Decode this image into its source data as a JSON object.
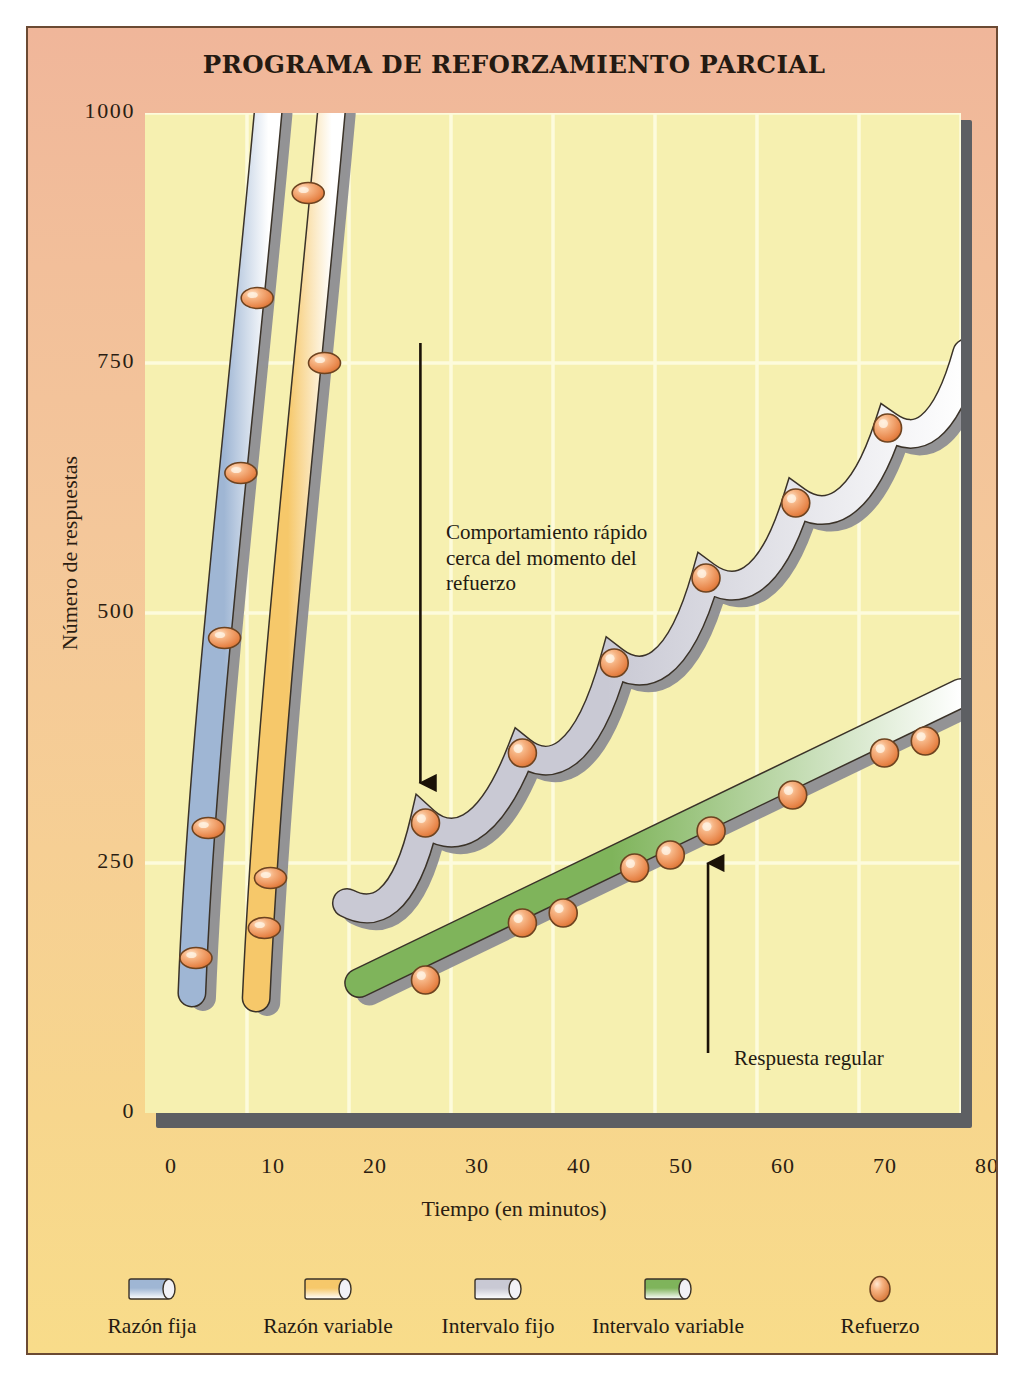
{
  "figure": {
    "title": "PROGRAMA DE REFORZAMIENTO PARCIAL",
    "frame_border_color": "#6b4a33",
    "bg_top_color": "#f0b69a",
    "bg_bottom_color": "#f8dc8a",
    "plot_bg_color": "#f6f0b0",
    "plot_shadow_color": "#5d5f63",
    "gridline_color": "#fdfbdc"
  },
  "annotations": [
    {
      "name": "fast-behavior-note",
      "text": "Comportamiento rápido cerca del momento del refuerzo",
      "arrow": "down"
    },
    {
      "name": "steady-response-note",
      "text": "Respuesta regular",
      "arrow": "up"
    }
  ],
  "legend": {
    "position": "bottom",
    "items": [
      {
        "label": "Razón fija",
        "icon": "cylinder-swatch",
        "color": "#9fb6d4",
        "shape": "cylinder"
      },
      {
        "label": "Razón variable",
        "icon": "cylinder-swatch",
        "color": "#f6c86a",
        "shape": "cylinder"
      },
      {
        "label": "Intervalo fijo",
        "icon": "cylinder-swatch",
        "color": "#c9c9d4",
        "shape": "cylinder"
      },
      {
        "label": "Intervalo variable",
        "icon": "cylinder-swatch",
        "color": "#7fb45b",
        "shape": "cylinder"
      },
      {
        "label": "Refuerzo",
        "icon": "sphere-swatch",
        "color": "#ef9a5f",
        "shape": "sphere"
      }
    ]
  },
  "chart_data": {
    "type": "line",
    "title": "PROGRAMA DE REFORZAMIENTO PARCIAL",
    "xlabel": "Tiempo (en minutos)",
    "ylabel": "Número de respuestas",
    "xlim": [
      0,
      80
    ],
    "ylim": [
      0,
      1000
    ],
    "xticks": [
      0,
      10,
      20,
      30,
      40,
      50,
      60,
      70,
      80
    ],
    "yticks": [
      0,
      250,
      500,
      750,
      1000
    ],
    "grid": true,
    "legend_position": "bottom",
    "marker_label": "Refuerzo",
    "series": [
      {
        "name": "Razón fija",
        "color": "#9fb6d4",
        "style": "thick-band",
        "description": "Muy rápida y constante; reforzadores a intervalos regulares de respuestas",
        "x": [
          4.5,
          5.0,
          6.2,
          7.8,
          9.4,
          11.0,
          12.6
        ],
        "y": [
          125,
          155,
          285,
          475,
          640,
          815,
          1000
        ],
        "reinforcement_points": [
          {
            "x": 5.0,
            "y": 155
          },
          {
            "x": 6.2,
            "y": 285
          },
          {
            "x": 7.8,
            "y": 475
          },
          {
            "x": 9.4,
            "y": 640
          },
          {
            "x": 11.0,
            "y": 815
          }
        ]
      },
      {
        "name": "Razón variable",
        "color": "#f6c86a",
        "style": "thick-band",
        "description": "Rápida y constante; reforzadores tras un número variable de respuestas",
        "x": [
          11.0,
          11.7,
          12.3,
          14.2,
          16.0,
          17.6,
          19.0
        ],
        "y": [
          120,
          185,
          235,
          490,
          750,
          920,
          1000
        ],
        "reinforcement_points": [
          {
            "x": 11.7,
            "y": 185
          },
          {
            "x": 12.3,
            "y": 235
          },
          {
            "x": 17.6,
            "y": 750
          },
          {
            "x": 16.0,
            "y": 920
          }
        ]
      },
      {
        "name": "Intervalo fijo",
        "color": "#c9c9d4",
        "style": "scalloped-band",
        "description": "Patrón festoneado: pausa después del refuerzo, aceleración antes del siguiente",
        "x": [
          19.5,
          23.0,
          27.5,
          32.0,
          37.0,
          41.5,
          46.0,
          50.5,
          55.0,
          59.5,
          63.8,
          68.5,
          72.8,
          77.0,
          80.0
        ],
        "y": [
          215,
          200,
          290,
          265,
          360,
          340,
          450,
          430,
          535,
          515,
          610,
          590,
          685,
          665,
          750
        ],
        "reinforcement_points": [
          {
            "x": 27.5,
            "y": 290
          },
          {
            "x": 37.0,
            "y": 360
          },
          {
            "x": 46.0,
            "y": 450
          },
          {
            "x": 55.0,
            "y": 535
          },
          {
            "x": 63.8,
            "y": 610
          },
          {
            "x": 72.8,
            "y": 685
          }
        ]
      },
      {
        "name": "Intervalo variable",
        "color": "#7fb45b",
        "style": "thick-band",
        "description": "Respuesta regular y moderada; reforzadores tras intervalos variables",
        "x": [
          21.0,
          80.0
        ],
        "y": [
          130,
          420
        ],
        "reinforcement_points": [
          {
            "x": 27.5,
            "y": 133
          },
          {
            "x": 37.0,
            "y": 190
          },
          {
            "x": 41.0,
            "y": 200
          },
          {
            "x": 48.0,
            "y": 245
          },
          {
            "x": 51.5,
            "y": 258
          },
          {
            "x": 55.5,
            "y": 282
          },
          {
            "x": 63.5,
            "y": 318
          },
          {
            "x": 72.5,
            "y": 360
          },
          {
            "x": 76.5,
            "y": 372
          }
        ]
      }
    ]
  }
}
